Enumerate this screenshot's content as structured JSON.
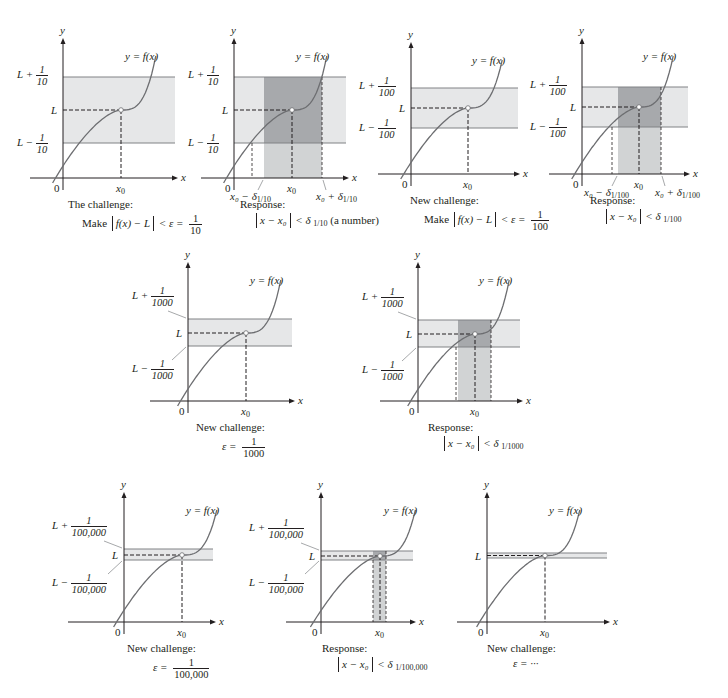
{
  "figure": {
    "colors": {
      "band": "#e6e7e8",
      "response_strip": "#d1d3d4",
      "overlap": "#a7a9ac",
      "curve": "#6d6e71",
      "axis": "#231f20",
      "band_edge": "#808285"
    },
    "common": {
      "curve_label": "y = f(x)",
      "y_axis_label": "y",
      "x_axis_label": "x",
      "origin_label": "0",
      "x0_label": "x",
      "x0_sub": "0",
      "L_label": "L"
    },
    "panels": [
      {
        "id": "p1",
        "kind": "challenge",
        "upper_label": "L +",
        "upper_frac": {
          "num": "1",
          "den": "10"
        },
        "lower_label": "L −",
        "lower_frac": {
          "num": "1",
          "den": "10"
        },
        "caption_title": "The challenge:",
        "caption_math": {
          "prefix": "Make",
          "abs": "f(x) − L",
          "rel": "< ε =",
          "frac": {
            "num": "1",
            "den": "10"
          }
        }
      },
      {
        "id": "p2",
        "kind": "response",
        "upper_label": "L +",
        "upper_frac": {
          "num": "1",
          "den": "10"
        },
        "lower_label": "L −",
        "lower_frac": {
          "num": "1",
          "den": "10"
        },
        "delta_left": "x₀ − δ",
        "delta_right": "x₀ + δ",
        "delta_sub": "1/10",
        "caption_title": "Response:",
        "caption_math": {
          "abs": "x − x₀",
          "rel": "< δ",
          "sub": "1/10",
          "suffix": "(a number)"
        }
      },
      {
        "id": "p3",
        "kind": "challenge",
        "upper_label": "L +",
        "upper_frac": {
          "num": "1",
          "den": "100"
        },
        "lower_label": "L −",
        "lower_frac": {
          "num": "1",
          "den": "100"
        },
        "caption_title": "New challenge:",
        "caption_math": {
          "prefix": "Make",
          "abs": "f(x) − L",
          "rel": "< ε =",
          "frac": {
            "num": "1",
            "den": "100"
          }
        }
      },
      {
        "id": "p4",
        "kind": "response",
        "upper_label": "L +",
        "upper_frac": {
          "num": "1",
          "den": "100"
        },
        "lower_label": "L −",
        "lower_frac": {
          "num": "1",
          "den": "100"
        },
        "delta_left": "x₀ − δ",
        "delta_right": "x₀ + δ",
        "delta_sub": "1/100",
        "caption_title": "Response:",
        "caption_math": {
          "abs": "x − x₀",
          "rel": "< δ",
          "sub": "1/100",
          "suffix": ""
        }
      },
      {
        "id": "p5",
        "kind": "challenge",
        "upper_label": "L +",
        "upper_frac": {
          "num": "1",
          "den": "1000"
        },
        "lower_label": "L −",
        "lower_frac": {
          "num": "1",
          "den": "1000"
        },
        "caption_title": "New challenge:",
        "caption_math": {
          "prefix": "",
          "abs": "",
          "rel": "ε =",
          "frac": {
            "num": "1",
            "den": "1000"
          }
        }
      },
      {
        "id": "p6",
        "kind": "response",
        "upper_label": "L +",
        "upper_frac": {
          "num": "1",
          "den": "1000"
        },
        "lower_label": "L −",
        "lower_frac": {
          "num": "1",
          "den": "1000"
        },
        "caption_title": "Response:",
        "caption_math": {
          "abs": "x − x₀",
          "rel": "< δ",
          "sub": "1/1000",
          "suffix": ""
        }
      },
      {
        "id": "p7",
        "kind": "challenge",
        "upper_label": "L +",
        "upper_frac": {
          "num": "1",
          "den": "100,000"
        },
        "lower_label": "L −",
        "lower_frac": {
          "num": "1",
          "den": "100,000"
        },
        "caption_title": "New challenge:",
        "caption_math": {
          "prefix": "",
          "abs": "",
          "rel": "ε =",
          "frac": {
            "num": "1",
            "den": "100,000"
          }
        }
      },
      {
        "id": "p8",
        "kind": "response",
        "upper_label": "L +",
        "upper_frac": {
          "num": "1",
          "den": "100,000"
        },
        "lower_label": "L −",
        "lower_frac": {
          "num": "1",
          "den": "100,000"
        },
        "caption_title": "Response:",
        "caption_math": {
          "abs": "x − x₀",
          "rel": "< δ",
          "sub": "1/100,000",
          "suffix": ""
        }
      },
      {
        "id": "p9",
        "kind": "challenge",
        "caption_title": "New challenge:",
        "caption_math": {
          "prefix": "",
          "abs": "",
          "rel": "ε = ···"
        }
      }
    ]
  }
}
